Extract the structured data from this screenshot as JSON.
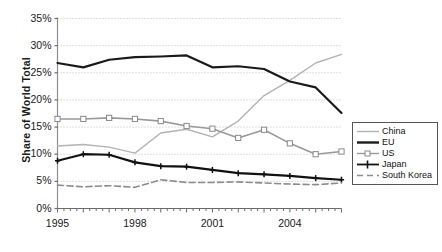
{
  "chart_data": {
    "type": "line",
    "title": "",
    "xlabel": "",
    "ylabel": "Share of World Total",
    "x": [
      1995,
      1996,
      1997,
      1998,
      1999,
      2000,
      2001,
      2002,
      2003,
      2004,
      2005,
      2006
    ],
    "xtick_labels": [
      "1995",
      "1998",
      "2001",
      "2004"
    ],
    "xtick_values": [
      1995,
      1998,
      2001,
      2004
    ],
    "xlim": [
      1995,
      2006
    ],
    "ylim": [
      0,
      35
    ],
    "ytick_labels": [
      "0%",
      "5%",
      "10%",
      "15%",
      "20%",
      "25%",
      "30%",
      "35%"
    ],
    "ytick_values": [
      0,
      5,
      10,
      15,
      20,
      25,
      30,
      35
    ],
    "yunit": "%",
    "grid": "horizontal-dotted",
    "legend_position": "right-middle",
    "series": [
      {
        "name": "China",
        "color": "#b3b3b3",
        "style": "solid-thin",
        "marker": "none",
        "values": [
          11.5,
          11.8,
          11.3,
          10.2,
          13.9,
          14.6,
          13.2,
          16.1,
          20.8,
          23.6,
          26.8,
          28.4
        ]
      },
      {
        "name": "EU",
        "color": "#1a1a1a",
        "style": "solid-thick",
        "marker": "none",
        "values": [
          26.8,
          26.0,
          27.4,
          27.9,
          28.0,
          28.2,
          26.0,
          26.2,
          25.7,
          23.4,
          22.3,
          17.6
        ]
      },
      {
        "name": "US",
        "color": "#999999",
        "style": "solid-medium",
        "marker": "square-open",
        "values": [
          16.5,
          16.5,
          16.7,
          16.5,
          16.1,
          15.2,
          14.7,
          13.0,
          14.5,
          12.0,
          10.0,
          10.5
        ]
      },
      {
        "name": "Japan",
        "color": "#111111",
        "style": "solid-thick",
        "marker": "plus",
        "values": [
          8.8,
          10.0,
          9.9,
          8.5,
          7.8,
          7.7,
          7.1,
          6.5,
          6.3,
          6.0,
          5.6,
          5.3
        ]
      },
      {
        "name": "South Korea",
        "color": "#8c8c8c",
        "style": "dashed",
        "marker": "none",
        "values": [
          4.3,
          4.0,
          4.2,
          3.9,
          5.3,
          4.8,
          4.8,
          4.9,
          4.7,
          4.5,
          4.4,
          4.7
        ]
      }
    ]
  },
  "legend": {
    "items": [
      {
        "label": "China"
      },
      {
        "label": "EU"
      },
      {
        "label": "US"
      },
      {
        "label": "Japan"
      },
      {
        "label": "South Korea"
      }
    ]
  },
  "axis": {
    "y_title": "Share of World Total"
  }
}
